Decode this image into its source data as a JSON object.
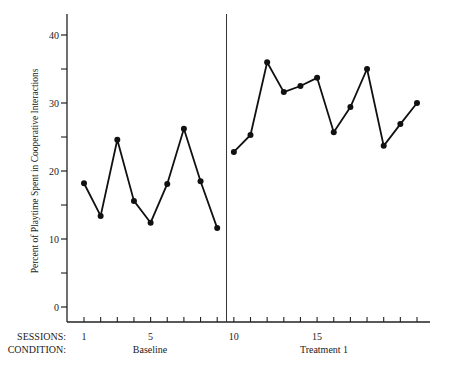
{
  "chart_data": {
    "type": "line",
    "title": "",
    "xlabel": "SESSIONS",
    "ylabel": "Percent of Playtime Spent in Cooperative Interactions",
    "ylim": [
      0,
      40
    ],
    "yticks_labeled": [
      0,
      10,
      20,
      30,
      40
    ],
    "yticks_minor": [
      5,
      15,
      25,
      35
    ],
    "xlim": [
      1,
      21
    ],
    "xticks_labeled": [
      1,
      5,
      10,
      15
    ],
    "row_labels": {
      "sessions": "SESSIONS:",
      "condition": "CONDITION:"
    },
    "phase_change_after_session": 9.5,
    "grid": false,
    "legend": null,
    "phases": [
      {
        "name": "Baseline",
        "label_x_session": 5
      },
      {
        "name": "Treatment  1",
        "label_x_session": 15
      }
    ],
    "series": [
      {
        "name": "Baseline",
        "x": [
          1,
          2,
          3,
          4,
          5,
          6,
          7,
          8,
          9
        ],
        "values": [
          18.2,
          13.4,
          24.6,
          15.6,
          12.4,
          18.1,
          26.2,
          18.5,
          11.6
        ]
      },
      {
        "name": "Treatment 1",
        "x": [
          10,
          11,
          12,
          13,
          14,
          15,
          16,
          17,
          18,
          19,
          20,
          21
        ],
        "values": [
          22.8,
          25.3,
          36.0,
          31.6,
          32.5,
          33.7,
          25.7,
          29.4,
          35.0,
          23.7,
          26.9,
          30.0
        ]
      }
    ]
  },
  "labels": {
    "sessions": "SESSIONS:",
    "condition": "CONDITION:",
    "baseline": "Baseline",
    "treatment": "Treatment  1",
    "ylabel": "Percent of Playtime Spent in Cooperative Interactions"
  }
}
